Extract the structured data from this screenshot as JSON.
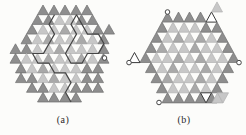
{
  "page": {
    "background": "#fcfcfa"
  },
  "colors": {
    "dark": "#8e8e8e",
    "darkStroke": "#6e6e6e",
    "medium": "#a9a9a9",
    "mediumStroke": "#949494",
    "light": "#c7c7c7",
    "lightStroke": "#b2b2b2",
    "outlinedFill": "#ffffff",
    "outlinedStroke": "#3a3a3a",
    "wall": "#454545",
    "circleFill": "#ffffff",
    "circleStroke": "#454545"
  },
  "figures": [
    {
      "id": "a",
      "label": "(a)",
      "x0": 10,
      "y0": 5,
      "base": 11,
      "rowH": 9.7,
      "strips": [
        {
          "hu": 5,
          "cells": "DDDDD"
        },
        {
          "hu": 4,
          "cells": "DDLLDD"
        },
        {
          "hu": 3,
          "cells": "DLLMLLDD"
        },
        {
          "hu": 2,
          "cells": "DLMLLMLD"
        },
        {
          "hu": 0,
          "cells": "DDLLMLLLD"
        },
        {
          "hu": 0,
          "cells": "DLLMLLMLD"
        },
        {
          "hu": 1,
          "cells": "DLMLLLDD"
        },
        {
          "hu": 1,
          "cells": "DDLMLLDD"
        },
        {
          "hu": 3,
          "cells": "DDLLDDD"
        },
        {
          "hu": 5,
          "cells": "DDDD"
        }
      ],
      "walls": [
        [
          [
            54.5,
            14.7
          ],
          [
            49,
            24.4
          ],
          [
            54.5,
            34.1
          ],
          [
            49,
            43.8
          ],
          [
            43.5,
            53.5
          ],
          [
            32.5,
            53.5
          ],
          [
            38,
            63.2
          ],
          [
            49,
            63.2
          ],
          [
            54.5,
            72.9
          ],
          [
            65.5,
            72.9
          ],
          [
            71,
            82.6
          ],
          [
            65.5,
            92.3
          ],
          [
            71,
            102
          ]
        ],
        [
          [
            76.5,
            14.7
          ],
          [
            82,
            24.4
          ],
          [
            87.5,
            34.1
          ],
          [
            98.5,
            34.1
          ],
          [
            104,
            43.8
          ],
          [
            98.5,
            53.5
          ],
          [
            87.5,
            53.5
          ],
          [
            82,
            63.2
          ],
          [
            71,
            63.2
          ],
          [
            65.5,
            53.5
          ],
          [
            71,
            43.8
          ],
          [
            76.5,
            34.1
          ],
          [
            71,
            24.4
          ],
          [
            76.5,
            14.7
          ]
        ]
      ],
      "extras": [],
      "circles": [
        [
          104.5,
          58
        ]
      ]
    },
    {
      "id": "b",
      "label": "(b)",
      "x0": 140,
      "y0": 12,
      "base": 11,
      "rowH": 10.1,
      "strips": [
        {
          "hu": 4,
          "cells": "DDDDO"
        },
        {
          "hu": 3,
          "cells": "DLLLDD"
        },
        {
          "hu": 2,
          "cells": "DLMLMLD"
        },
        {
          "hu": 1,
          "cells": "DMLLMLLD"
        },
        {
          "hu": 0,
          "cells": "DLLMLMLLD"
        },
        {
          "hu": 1,
          "cells": "DLMLLMLD"
        },
        {
          "hu": 2,
          "cells": "DMLLMLD"
        },
        {
          "hu": 3,
          "cells": "DLLMLD"
        },
        {
          "hu": 4,
          "cells": "DDDDD"
        }
      ],
      "walls": [],
      "extras": [
        {
          "type": "up",
          "x": 211.5,
          "y": 1.9,
          "fill": "light"
        },
        {
          "type": "up",
          "x": 129,
          "y": 52.5,
          "fill": "outlined"
        },
        {
          "type": "down",
          "x": 200.5,
          "y": 92.8,
          "fill": "outlined"
        },
        {
          "type": "up",
          "x": 212,
          "y": 92.8,
          "fill": "light"
        },
        {
          "type": "down",
          "x": 217.5,
          "y": 92.8,
          "fill": "light"
        }
      ],
      "circles": [
        [
          167.5,
          12
        ],
        [
          239,
          62.6
        ],
        [
          129,
          62.6
        ],
        [
          159,
          102.5
        ]
      ]
    }
  ]
}
